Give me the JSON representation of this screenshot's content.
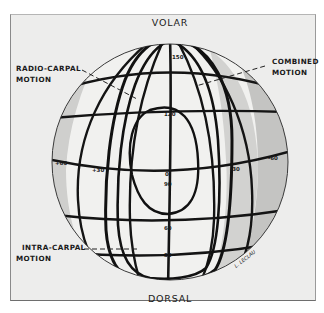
{
  "figure": {
    "poles": {
      "top": "VOLAR",
      "bottom": "DORSAL"
    },
    "labels": {
      "radio_carpal": [
        "RADIO-CARPAL",
        "MOTION"
      ],
      "combined": [
        "COMBINED",
        "MOTION"
      ],
      "intra_carpal": [
        "INTRA-CARPAL",
        "MOTION"
      ]
    },
    "meridian_ticks": [
      "150",
      "120",
      "0",
      "90",
      "60",
      "30"
    ],
    "equator_ticks": {
      "far_left": "+60",
      "left": "+30",
      "right": "-30",
      "far_right": "-60"
    },
    "signature": "L. LECLAU",
    "colors": {
      "background": "#ededec",
      "globe_light": "#f3f3f2",
      "globe_shade": "#c9c9c7",
      "ink": "#141414"
    }
  }
}
